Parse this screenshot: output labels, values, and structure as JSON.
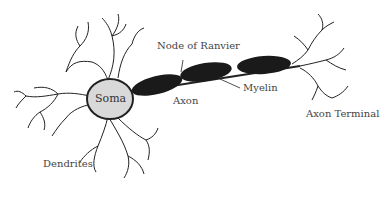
{
  "diagram": {
    "labels": {
      "soma": "Soma",
      "dendrites": "Dendrites",
      "node_of_ranvier": "Node of Ranvier",
      "axon": "Axon",
      "myelin": "Myelin",
      "axon_terminal": "Axon Terminal"
    },
    "colors": {
      "soma_fill": "#d9d9d9",
      "myelin_fill": "#1a1a1a",
      "outline": "#222222",
      "label_text": "#444444"
    }
  }
}
